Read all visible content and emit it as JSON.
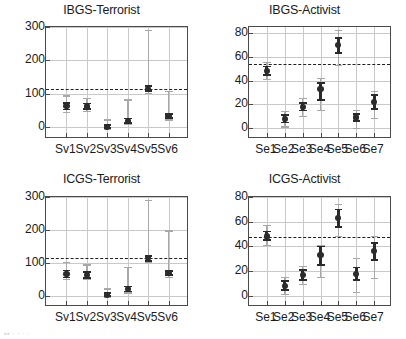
{
  "figure": {
    "layout": "2x2 grid of error-bar panels",
    "marker_color": "#2b2b2b",
    "inner_bar_color": "#2a2a2a",
    "outer_bar_color": "#a8a8a8",
    "refline_color": "#1f1f1f",
    "grid_color": "#c9c9c9",
    "axis_color": "#4a4a4a",
    "bottom_artifact_text": "▪▪   ·   ·   ·   ·"
  },
  "chart_data": [
    {
      "id": "ibgs-terrorist",
      "type": "scatter",
      "title": "IBGS-Terrorist",
      "xlabel": "",
      "ylabel": "",
      "ylim": [
        -35,
        300
      ],
      "yticks": [
        0,
        100,
        200,
        300
      ],
      "ytick_labels": [
        "0",
        "100",
        "200",
        "300"
      ],
      "categories": [
        "Sv1",
        "Sv2",
        "Sv3",
        "Sv4",
        "Sv5",
        "Sv6"
      ],
      "grid": true,
      "legend": "none",
      "reference_line": 115,
      "series": [
        {
          "name": "mean",
          "values": [
            63,
            62,
            2,
            19,
            115,
            33
          ]
        },
        {
          "name": "inner_lower",
          "values": [
            53,
            54,
            -2,
            12,
            108,
            27
          ]
        },
        {
          "name": "inner_upper",
          "values": [
            72,
            71,
            7,
            26,
            123,
            40
          ]
        },
        {
          "name": "outer_lower",
          "values": [
            45,
            48,
            -6,
            8,
            102,
            22
          ]
        },
        {
          "name": "outer_upper",
          "values": [
            94,
            86,
            22,
            82,
            290,
            108
          ]
        }
      ]
    },
    {
      "id": "ibgs-activist",
      "type": "scatter",
      "title": "IBGS-Activist",
      "xlabel": "",
      "ylabel": "",
      "ylim": [
        -9,
        85
      ],
      "yticks": [
        0,
        20,
        40,
        60,
        80
      ],
      "ytick_labels": [
        "0",
        "20",
        "40",
        "60",
        "80"
      ],
      "categories": [
        "Se1",
        "Se2",
        "Se3",
        "Se4",
        "Se5",
        "Se6",
        "Se7"
      ],
      "grid": true,
      "legend": "none",
      "reference_line": 54,
      "series": [
        {
          "name": "mean",
          "values": [
            48,
            8,
            18,
            33,
            70,
            9,
            22
          ]
        },
        {
          "name": "inner_lower",
          "values": [
            45,
            5,
            15,
            24,
            63,
            6,
            16
          ]
        },
        {
          "name": "inner_upper",
          "values": [
            52,
            11,
            21,
            38,
            76,
            12,
            28
          ]
        },
        {
          "name": "outer_lower",
          "values": [
            41,
            1,
            10,
            15,
            53,
            0,
            8
          ]
        },
        {
          "name": "outer_upper",
          "values": [
            55,
            14,
            25,
            42,
            82,
            15,
            31
          ]
        }
      ]
    },
    {
      "id": "icgs-terrorist",
      "type": "scatter",
      "title": "ICGS-Terrorist",
      "xlabel": "",
      "ylabel": "",
      "ylim": [
        -35,
        300
      ],
      "yticks": [
        0,
        100,
        200,
        300
      ],
      "ytick_labels": [
        "0",
        "100",
        "200",
        "300"
      ],
      "categories": [
        "Sv1",
        "Sv2",
        "Sv3",
        "Sv4",
        "Sv5",
        "Sv6"
      ],
      "grid": true,
      "legend": "none",
      "reference_line": 115,
      "series": [
        {
          "name": "mean",
          "values": [
            66,
            63,
            2,
            20,
            113,
            68
          ]
        },
        {
          "name": "inner_lower",
          "values": [
            55,
            54,
            -2,
            12,
            106,
            62
          ]
        },
        {
          "name": "inner_upper",
          "values": [
            76,
            72,
            7,
            28,
            121,
            75
          ]
        },
        {
          "name": "outer_lower",
          "values": [
            48,
            48,
            -6,
            8,
            100,
            56
          ]
        },
        {
          "name": "outer_upper",
          "values": [
            100,
            93,
            20,
            86,
            289,
            197
          ]
        }
      ]
    },
    {
      "id": "icgs-activist",
      "type": "scatter",
      "title": "ICGS-Activist",
      "xlabel": "",
      "ylabel": "",
      "ylim": [
        -9,
        80
      ],
      "yticks": [
        0,
        20,
        40,
        60,
        80
      ],
      "ytick_labels": [
        "0",
        "20",
        "40",
        "60",
        "80"
      ],
      "categories": [
        "Se1",
        "Se2",
        "Se3",
        "Se4",
        "Se5",
        "Se6",
        "Se7"
      ],
      "grid": true,
      "legend": "none",
      "reference_line": 48,
      "series": [
        {
          "name": "mean",
          "values": [
            48,
            8,
            17,
            33,
            63,
            18,
            36
          ]
        },
        {
          "name": "inner_lower",
          "values": [
            45,
            5,
            13,
            25,
            56,
            13,
            29
          ]
        },
        {
          "name": "inner_upper",
          "values": [
            52,
            12,
            21,
            40,
            70,
            23,
            43
          ]
        },
        {
          "name": "outer_lower",
          "values": [
            41,
            1,
            9,
            15,
            48,
            3,
            14
          ]
        },
        {
          "name": "outer_upper",
          "values": [
            57,
            15,
            24,
            41,
            74,
            30,
            48
          ]
        }
      ]
    }
  ]
}
